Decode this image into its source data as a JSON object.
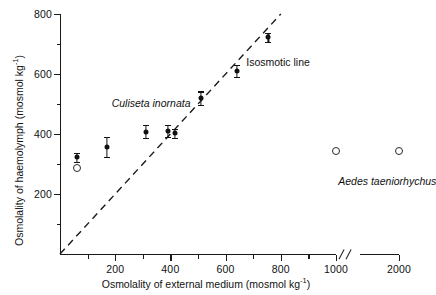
{
  "chart_data": {
    "type": "scatter",
    "title": "",
    "xlabel": "Osmolality of external medium (mosmol kg",
    "xlabel_sup": "-1",
    "xlabel_close": ")",
    "ylabel": "Osmolality of haemolymph (mosmol kg",
    "ylabel_sup": "-1",
    "ylabel_close": ")",
    "xlim": [
      0,
      2000
    ],
    "ylim": [
      0,
      800
    ],
    "x_axis_break": {
      "after": 1000,
      "before": 2000,
      "symbol": "//"
    },
    "grid": false,
    "legend": "none",
    "x_major_ticks": [
      200,
      400,
      600,
      800,
      1000,
      2000
    ],
    "x_tick_labels": [
      "200",
      "400",
      "600",
      "800",
      "1000",
      "2000"
    ],
    "x_minor_ticks": [
      100,
      300,
      500,
      700,
      900
    ],
    "y_major_ticks": [
      200,
      400,
      600,
      800
    ],
    "y_tick_labels": [
      "200",
      "400",
      "600",
      "800"
    ],
    "y_minor_ticks": [
      100,
      300,
      500,
      700
    ],
    "annotations": [
      {
        "text": "Culiseta inornata",
        "x": 330,
        "y": 505,
        "style": "italic"
      },
      {
        "text": "Isosmotic line",
        "x": 790,
        "y": 640,
        "style": "normal"
      },
      {
        "text": "Aedes taeniorhychus",
        "x": 1700,
        "y": 245,
        "style": "italic"
      }
    ],
    "reference_line": {
      "name": "Isosmotic line",
      "style": "dashed",
      "from": [
        0,
        0
      ],
      "to": [
        800,
        800
      ],
      "slope": 1,
      "intercept": 0
    },
    "series": [
      {
        "name": "Culiseta inornata",
        "marker": "filled-circle",
        "points": [
          {
            "x": 60,
            "y": 322,
            "err": 14
          },
          {
            "x": 170,
            "y": 356,
            "err": 33
          },
          {
            "x": 310,
            "y": 408,
            "err": 22
          },
          {
            "x": 390,
            "y": 410,
            "err": 20
          },
          {
            "x": 415,
            "y": 402,
            "err": 14
          },
          {
            "x": 510,
            "y": 520,
            "err": 22
          },
          {
            "x": 640,
            "y": 610,
            "err": 20
          },
          {
            "x": 755,
            "y": 722,
            "err": 16
          }
        ]
      },
      {
        "name": "Aedes taeniorhychus",
        "marker": "open-circle",
        "points": [
          {
            "x": 60,
            "y": 287,
            "err": 0
          },
          {
            "x": 1000,
            "y": 345,
            "err": 0
          },
          {
            "x": 2000,
            "y": 345,
            "err": 0
          }
        ]
      }
    ]
  }
}
